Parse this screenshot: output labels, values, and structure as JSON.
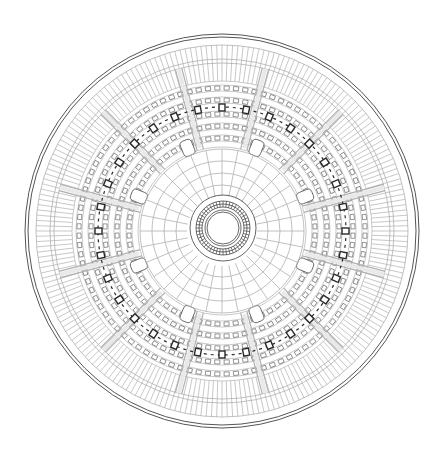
{
  "drawing": {
    "kind": "circular architectural floor plan",
    "center": [
      222,
      231
    ],
    "line_color": "#555555",
    "light_line_color": "#b0b0b0",
    "dark_line_color": "#2a2a2a",
    "background": "#ffffff",
    "outer_rings": [
      197,
      194,
      186,
      172,
      168
    ],
    "outer_ribs": {
      "r_in": 150,
      "r_out": 186,
      "count": 220
    },
    "seating_rings": [
      150,
      146,
      140,
      134,
      128,
      120,
      114,
      108,
      102,
      96,
      90,
      84
    ],
    "seat_blocks": [
      {
        "r": 143,
        "count": 96
      },
      {
        "r": 131,
        "count": 88
      },
      {
        "r": 117,
        "count": 80
      },
      {
        "r": 105,
        "count": 72
      },
      {
        "r": 93,
        "count": 64
      }
    ],
    "column_ring": {
      "r": 124,
      "count": 32,
      "size": 6
    },
    "aisles": {
      "count": 12,
      "r_in": 84,
      "r_out": 168,
      "offset_deg": 15
    },
    "vomitories": {
      "count": 8,
      "r": 82,
      "w": 12,
      "h": 16,
      "offset_deg": 22.5
    },
    "inner_field": {
      "rings": [
        82,
        70,
        58,
        46
      ],
      "radials": 32
    },
    "core": {
      "center": [
        223,
        228
      ],
      "rings": [
        33,
        27,
        24,
        21,
        18,
        16
      ],
      "ticks": 48
    }
  }
}
